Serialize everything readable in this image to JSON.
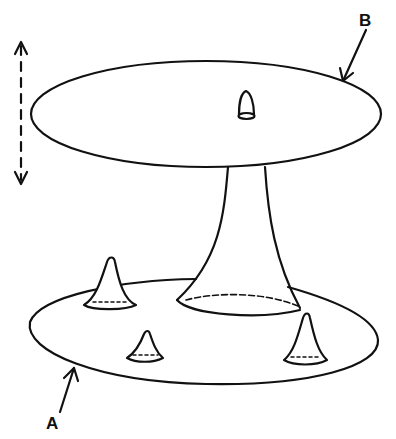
{
  "diagram": {
    "labels": {
      "top_surface": "B",
      "bottom_surface": "A"
    },
    "elements": [
      {
        "name": "surface-B",
        "shape": "ellipse",
        "description": "upper flat disc"
      },
      {
        "name": "surface-A",
        "shape": "ellipse",
        "description": "lower flat disc"
      },
      {
        "name": "stem",
        "shape": "flared neck",
        "description": "tube connecting lower disc to upper disc"
      },
      {
        "name": "bump-on-B",
        "shape": "small cone",
        "count": 1
      },
      {
        "name": "cones-on-A",
        "shape": "small cone",
        "count": 3
      },
      {
        "name": "vertical-motion-arrow",
        "shape": "dashed double arrow"
      }
    ],
    "stroke_color": "#111111",
    "background_color": "#ffffff"
  }
}
